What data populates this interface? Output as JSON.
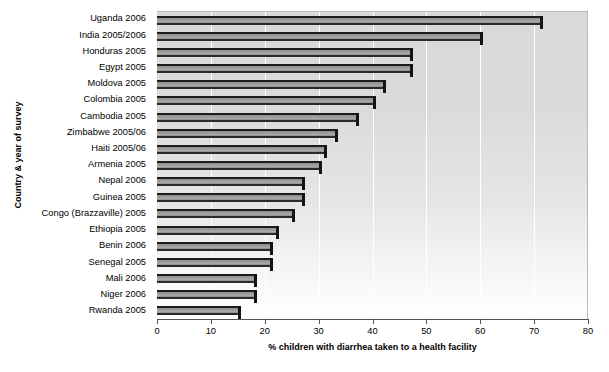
{
  "chart_data": {
    "type": "bar",
    "orientation": "horizontal",
    "title": "",
    "xlabel": "% children with diarrhea taken to a health facility",
    "ylabel": "Country & year of survey",
    "xlim": [
      0,
      80
    ],
    "xticks": [
      0,
      10,
      20,
      30,
      40,
      50,
      60,
      70,
      80
    ],
    "grid": "vertical-white",
    "legend": "none",
    "categories": [
      "Uganda 2006",
      "India 2005/2006",
      "Honduras 2005",
      "Egypt 2005",
      "Moldova 2005",
      "Colombia 2005",
      "Cambodia 2005",
      "Zimbabwe 2005/06",
      "Haiti 2005/06",
      "Armenia 2005",
      "Nepal 2006",
      "Guinea 2005",
      "Congo (Brazzaville) 2005",
      "Ethiopia 2005",
      "Benin 2006",
      "Senegal 2005",
      "Mali 2006",
      "Niger 2006",
      "Rwanda 2005"
    ],
    "values": [
      71,
      60,
      47,
      47,
      42,
      40,
      37,
      33,
      31,
      30,
      27,
      27,
      25,
      22,
      21,
      21,
      18,
      18,
      15
    ],
    "bar_color": "#9e9e9e",
    "bar_edge_color": "#1c1c1c",
    "plot_bg_top": "#d9d9d9",
    "plot_bg_bottom": "#ffffff"
  }
}
